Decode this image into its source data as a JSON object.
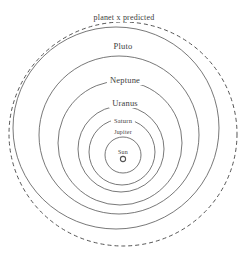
{
  "figure": {
    "name": "solar-system-orbits-with-predicted-planet-x",
    "background_color": "#ffffff",
    "line_color": "#555555",
    "text_color": "#3d3d3d"
  },
  "chart_data": {
    "type": "diagram",
    "title": "",
    "center_label": "Sun",
    "orbits": [
      {
        "label": "planet x predicted",
        "style": "dashed",
        "order": 1,
        "cx": 123,
        "cy": 134,
        "rx": 114,
        "ry": 112,
        "label_x": 124,
        "label_y": 14
      },
      {
        "label": "Pluto",
        "style": "solid",
        "order": 2,
        "cx": 116,
        "cy": 128,
        "rx": 103,
        "ry": 101,
        "label_x": 123,
        "label_y": 42
      },
      {
        "label": "Neptune",
        "style": "solid",
        "order": 3,
        "cx": 119,
        "cy": 135,
        "rx": 80,
        "ry": 79,
        "label_x": 125,
        "label_y": 76
      },
      {
        "label": "Uranus",
        "style": "solid",
        "order": 4,
        "cx": 120,
        "cy": 143,
        "rx": 62,
        "ry": 62,
        "label_x": 125,
        "label_y": 99
      },
      {
        "label": "Saturn",
        "style": "solid",
        "order": 5,
        "cx": 121,
        "cy": 149,
        "rx": 43,
        "ry": 43,
        "label_x": 123,
        "label_y": 118
      },
      {
        "label": "Jupiter",
        "style": "solid",
        "order": 6,
        "cx": 122,
        "cy": 152,
        "rx": 33,
        "ry": 33,
        "label_x": 123,
        "label_y": 129
      },
      {
        "label": "Sun",
        "style": "solid",
        "order": 7,
        "cx": 123,
        "cy": 155,
        "rx": 18,
        "ry": 18,
        "label_x": 123,
        "label_y": 149
      }
    ],
    "sun_marker": {
      "label": "sun-marker",
      "cx": 123,
      "cy": 159,
      "r": 2.6
    }
  }
}
